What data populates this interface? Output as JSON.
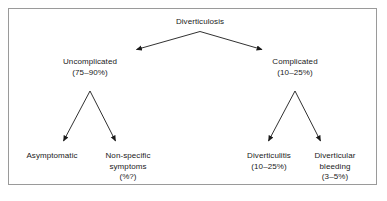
{
  "figure": {
    "type": "flowchart",
    "title_node": {
      "id": "diverticulosis",
      "label": "Diverticulosis"
    },
    "branches": [
      {
        "id": "uncomplicated",
        "label": "Uncomplicated",
        "value": "(75–90%)"
      },
      {
        "id": "complicated",
        "label": "Complicated",
        "value": "(10–25%)"
      }
    ],
    "leaves": [
      {
        "id": "asymptomatic",
        "line1": "Asymptomatic",
        "line2": "",
        "value": ""
      },
      {
        "id": "non-specific-symptoms",
        "line1": "Non-specific",
        "line2": "symptoms",
        "value": "(%?)"
      },
      {
        "id": "diverticulitis",
        "line1": "Diverticulitis",
        "line2": "",
        "value": "(10–25%)"
      },
      {
        "id": "diverticular-bleeding",
        "line1": "Diverticular",
        "line2": "bleeding",
        "value": "(3–5%)"
      }
    ],
    "colors": {
      "border": "#9a9a9a",
      "text": "#1a1a1a",
      "arrow": "#1a1a1a",
      "background": "#ffffff"
    }
  }
}
